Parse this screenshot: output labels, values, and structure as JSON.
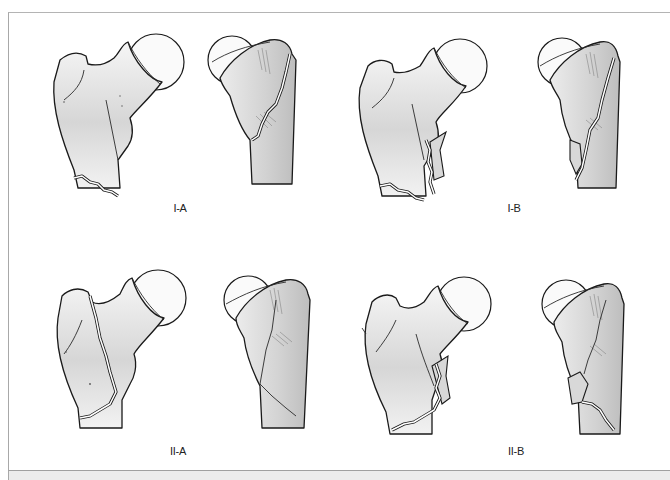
{
  "figure": {
    "type": "medical-illustration",
    "panels": [
      {
        "id": "I-A",
        "label": "I-A",
        "views": [
          "anterior",
          "lateral"
        ]
      },
      {
        "id": "I-B",
        "label": "I-B",
        "views": [
          "anterior",
          "lateral"
        ]
      },
      {
        "id": "II-A",
        "label": "II-A",
        "views": [
          "anterior",
          "lateral"
        ]
      },
      {
        "id": "II-B",
        "label": "II-B",
        "views": [
          "anterior",
          "lateral"
        ]
      }
    ]
  },
  "colors": {
    "background": "#ffffff",
    "bone_fill_light": "#f4f4f4",
    "bone_fill_dark": "#cfcfcf",
    "outline": "#1a1a1a",
    "frame_border": "#a8a8a8",
    "footer_band": "#ececec"
  }
}
